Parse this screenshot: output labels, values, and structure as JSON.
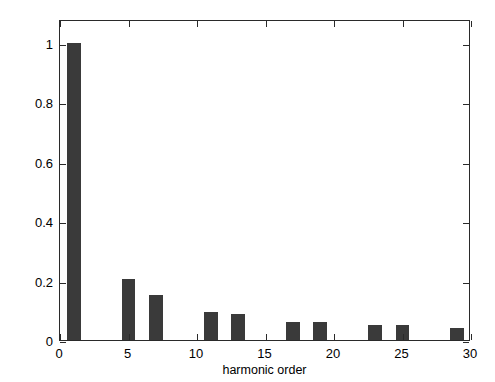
{
  "chart_data": {
    "type": "bar",
    "title": "",
    "xlabel": "harmonic order",
    "ylabel": "normalized amplitude = In/I1",
    "ylabel_plain": "normalized amplitude = ",
    "ylabel_italic": "In/I1",
    "xlim": [
      0,
      30
    ],
    "ylim": [
      0,
      1.08
    ],
    "xticks": [
      0,
      5,
      10,
      15,
      20,
      25,
      30
    ],
    "xtick_labels": [
      "0",
      "5",
      "10",
      "15",
      "20",
      "25",
      "30"
    ],
    "yticks": [
      0,
      0.2,
      0.4,
      0.6,
      0.8,
      1
    ],
    "ytick_labels": [
      "0",
      "0.2",
      "0.4",
      "0.6",
      "0.8",
      "1"
    ],
    "grid": false,
    "legend": null,
    "bar_color": "#3a3a3a",
    "bar_width": 1.0,
    "categories": [
      1,
      5,
      7,
      11,
      13,
      17,
      19,
      23,
      25,
      29
    ],
    "values": [
      1.0,
      0.205,
      0.15,
      0.095,
      0.086,
      0.062,
      0.06,
      0.05,
      0.049,
      0.042
    ],
    "points": [
      {
        "x": 1,
        "y": 1.0
      },
      {
        "x": 5,
        "y": 0.205
      },
      {
        "x": 7,
        "y": 0.15
      },
      {
        "x": 11,
        "y": 0.095
      },
      {
        "x": 13,
        "y": 0.086
      },
      {
        "x": 17,
        "y": 0.062
      },
      {
        "x": 19,
        "y": 0.06
      },
      {
        "x": 23,
        "y": 0.05
      },
      {
        "x": 25,
        "y": 0.049
      },
      {
        "x": 29,
        "y": 0.042
      }
    ]
  }
}
